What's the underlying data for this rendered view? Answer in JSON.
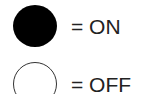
{
  "legend": {
    "items": [
      {
        "symbol": "filled-circle",
        "color": "#000000",
        "label": "= ON"
      },
      {
        "symbol": "open-circle",
        "color": "#ffffff",
        "label": "= OFF"
      }
    ]
  }
}
